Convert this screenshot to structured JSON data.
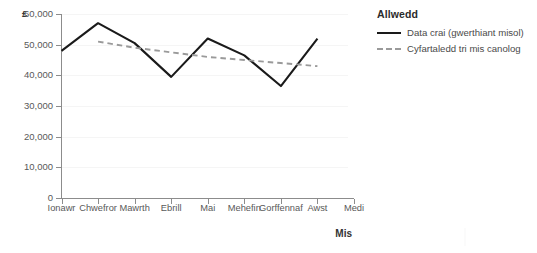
{
  "chart_data": {
    "type": "line",
    "title": "",
    "xlabel": "Mis",
    "ylabel": "£",
    "ylim": [
      0,
      60000
    ],
    "y_ticks": [
      "0",
      "10,000",
      "20,000",
      "30,000",
      "40,000",
      "50,000",
      "60,000"
    ],
    "y_tick_values": [
      0,
      10000,
      20000,
      30000,
      40000,
      50000,
      60000
    ],
    "grid": true,
    "grid_axis": "y",
    "legend_position": "right",
    "legend_title": "Allwedd",
    "categories": [
      "Ionawr",
      "Chwefror",
      "Mawrth",
      "Ebrill",
      "Mai",
      "Mehefin",
      "Gorffennaf",
      "Awst",
      "Medi"
    ],
    "series": [
      {
        "name": "Data crai (gwerthiant misol)",
        "style": "solid",
        "color": "#1a1a1a",
        "values": [
          48000,
          57000,
          50500,
          39500,
          52000,
          46500,
          36500,
          52000,
          null
        ]
      },
      {
        "name": "Cyfartaledd tri mis canolog",
        "style": "dashed",
        "color": "#9a9a9a",
        "values": [
          null,
          51000,
          49000,
          47500,
          46000,
          45000,
          44000,
          43000,
          null
        ]
      }
    ]
  },
  "axis": {
    "y_unit": "£",
    "x_title": "Mis"
  },
  "legend": {
    "title": "Allwedd",
    "items": [
      {
        "label": "Data crai (gwerthiant misol)",
        "style": "solid"
      },
      {
        "label": "Cyfartaledd tri mis canolog",
        "style": "dashed"
      }
    ]
  }
}
